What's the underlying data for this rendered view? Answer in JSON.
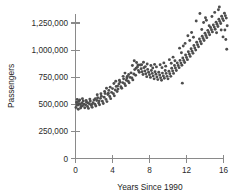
{
  "chart_data": {
    "type": "scatter",
    "title": "",
    "xlabel": "Years Since 1990",
    "ylabel": "Passengers",
    "xlim": [
      0,
      16.5
    ],
    "ylim": [
      0,
      1450000
    ],
    "xticks": [
      0,
      4,
      8,
      12,
      16
    ],
    "xtick_labels": [
      "0",
      "4",
      "8",
      "12",
      "16"
    ],
    "yticks": [
      0,
      250000,
      500000,
      750000,
      1000000,
      1250000
    ],
    "ytick_labels": [
      "0",
      "250,000",
      "500,000",
      "750,000",
      "1,000,000",
      "1,250,000"
    ],
    "grid": false,
    "legend": null,
    "marker_color": "#4d4d4d",
    "axis_color": "#8a8a8a",
    "background_color": "#ffffff",
    "series": [
      {
        "name": "Passengers",
        "points": [
          [
            0.05,
            470000
          ],
          [
            0.12,
            520000
          ],
          [
            0.18,
            545000
          ],
          [
            0.24,
            492000
          ],
          [
            0.3,
            455000
          ],
          [
            0.38,
            505000
          ],
          [
            0.45,
            540000
          ],
          [
            0.52,
            498000
          ],
          [
            0.6,
            478000
          ],
          [
            0.68,
            512000
          ],
          [
            0.76,
            487000
          ],
          [
            0.84,
            530000
          ],
          [
            0.92,
            500000
          ],
          [
            1.0,
            468000
          ],
          [
            1.1,
            495000
          ],
          [
            1.2,
            520000
          ],
          [
            1.3,
            480000
          ],
          [
            1.4,
            462000
          ],
          [
            1.5,
            505000
          ],
          [
            1.6,
            530000
          ],
          [
            1.7,
            490000
          ],
          [
            1.8,
            472000
          ],
          [
            1.9,
            515000
          ],
          [
            2.0,
            540000
          ],
          [
            2.1,
            500000
          ],
          [
            2.2,
            485000
          ],
          [
            2.3,
            535000
          ],
          [
            2.4,
            560000
          ],
          [
            2.5,
            512000
          ],
          [
            2.6,
            496000
          ],
          [
            2.7,
            555000
          ],
          [
            2.8,
            575000
          ],
          [
            2.9,
            528000
          ],
          [
            3.0,
            508000
          ],
          [
            3.1,
            565000
          ],
          [
            3.2,
            600000
          ],
          [
            3.3,
            545000
          ],
          [
            3.4,
            525000
          ],
          [
            3.5,
            590000
          ],
          [
            3.6,
            628000
          ],
          [
            3.7,
            572000
          ],
          [
            3.8,
            552000
          ],
          [
            3.9,
            610000
          ],
          [
            4.0,
            645000
          ],
          [
            4.1,
            598000
          ],
          [
            4.2,
            578000
          ],
          [
            4.3,
            632000
          ],
          [
            4.4,
            665000
          ],
          [
            4.5,
            618000
          ],
          [
            4.6,
            640000
          ],
          [
            4.7,
            688000
          ],
          [
            4.8,
            705000
          ],
          [
            4.9,
            662000
          ],
          [
            5.0,
            648000
          ],
          [
            5.1,
            700000
          ],
          [
            5.2,
            735000
          ],
          [
            5.3,
            690000
          ],
          [
            5.4,
            672000
          ],
          [
            5.5,
            722000
          ],
          [
            5.6,
            758000
          ],
          [
            5.7,
            712000
          ],
          [
            5.8,
            698000
          ],
          [
            5.9,
            748000
          ],
          [
            6.0,
            790000
          ],
          [
            6.1,
            742000
          ],
          [
            6.2,
            725000
          ],
          [
            6.3,
            780000
          ],
          [
            6.4,
            820000
          ],
          [
            6.5,
            768000
          ],
          [
            6.6,
            885000
          ],
          [
            6.7,
            845000
          ],
          [
            6.8,
            812000
          ],
          [
            6.9,
            795000
          ],
          [
            7.0,
            862000
          ],
          [
            7.1,
            828000
          ],
          [
            7.2,
            800000
          ],
          [
            7.3,
            775000
          ],
          [
            7.4,
            838000
          ],
          [
            7.5,
            808000
          ],
          [
            7.6,
            782000
          ],
          [
            7.7,
            755000
          ],
          [
            7.8,
            822000
          ],
          [
            7.9,
            795000
          ],
          [
            8.0,
            772000
          ],
          [
            8.1,
            748000
          ],
          [
            8.2,
            812000
          ],
          [
            8.3,
            785000
          ],
          [
            8.4,
            760000
          ],
          [
            8.5,
            735000
          ],
          [
            8.6,
            800000
          ],
          [
            8.7,
            778000
          ],
          [
            8.8,
            752000
          ],
          [
            8.9,
            728000
          ],
          [
            9.0,
            795000
          ],
          [
            9.1,
            770000
          ],
          [
            9.2,
            745000
          ],
          [
            9.3,
            722000
          ],
          [
            9.4,
            788000
          ],
          [
            9.5,
            762000
          ],
          [
            9.6,
            740000
          ],
          [
            9.7,
            812000
          ],
          [
            9.8,
            785000
          ],
          [
            9.9,
            758000
          ],
          [
            10.0,
            735000
          ],
          [
            10.1,
            805000
          ],
          [
            10.2,
            782000
          ],
          [
            10.3,
            758000
          ],
          [
            10.4,
            832000
          ],
          [
            10.5,
            808000
          ],
          [
            10.6,
            785000
          ],
          [
            10.7,
            858000
          ],
          [
            10.8,
            835000
          ],
          [
            10.9,
            812000
          ],
          [
            11.0,
            882000
          ],
          [
            11.1,
            858000
          ],
          [
            11.2,
            838000
          ],
          [
            11.3,
            905000
          ],
          [
            11.4,
            880000
          ],
          [
            11.5,
            860000
          ],
          [
            11.55,
            695000
          ],
          [
            11.6,
            928000
          ],
          [
            11.7,
            905000
          ],
          [
            11.8,
            885000
          ],
          [
            11.9,
            955000
          ],
          [
            12.0,
            932000
          ],
          [
            12.1,
            912000
          ],
          [
            12.2,
            985000
          ],
          [
            12.3,
            962000
          ],
          [
            12.4,
            942000
          ],
          [
            12.5,
            1012000
          ],
          [
            12.6,
            990000
          ],
          [
            12.7,
            970000
          ],
          [
            12.8,
            1042000
          ],
          [
            12.9,
            1020000
          ],
          [
            13.0,
            1000000
          ],
          [
            13.1,
            1072000
          ],
          [
            13.2,
            1050000
          ],
          [
            13.3,
            1030000
          ],
          [
            13.4,
            1102000
          ],
          [
            13.5,
            1080000
          ],
          [
            13.6,
            1058000
          ],
          [
            13.7,
            1128000
          ],
          [
            13.8,
            1108000
          ],
          [
            13.9,
            1088000
          ],
          [
            14.0,
            1155000
          ],
          [
            14.1,
            1135000
          ],
          [
            14.15,
            1275000
          ],
          [
            14.2,
            1115000
          ],
          [
            14.3,
            1182000
          ],
          [
            14.4,
            1162000
          ],
          [
            14.5,
            1142000
          ],
          [
            14.6,
            1208000
          ],
          [
            14.7,
            1188000
          ],
          [
            14.8,
            1168000
          ],
          [
            14.9,
            1232000
          ],
          [
            15.0,
            1212000
          ],
          [
            15.1,
            1192000
          ],
          [
            15.2,
            1258000
          ],
          [
            15.3,
            1238000
          ],
          [
            15.4,
            1218000
          ],
          [
            15.5,
            1285000
          ],
          [
            15.55,
            1398000
          ],
          [
            15.6,
            1265000
          ],
          [
            15.7,
            1245000
          ],
          [
            15.8,
            1312000
          ],
          [
            15.9,
            1290000
          ],
          [
            16.0,
            1272000
          ],
          [
            16.1,
            1340000
          ],
          [
            16.15,
            1185000
          ],
          [
            16.2,
            1318000
          ],
          [
            16.25,
            1098000
          ],
          [
            16.3,
            1295000
          ],
          [
            16.35,
            1008000
          ],
          [
            16.4,
            1225000
          ],
          [
            13.05,
            1268000
          ],
          [
            13.45,
            1338000
          ],
          [
            13.65,
            1190000
          ],
          [
            13.85,
            1255000
          ],
          [
            14.05,
            1298000
          ],
          [
            14.45,
            1225000
          ],
          [
            14.75,
            1310000
          ],
          [
            15.05,
            1348000
          ],
          [
            15.25,
            1160000
          ],
          [
            15.45,
            1372000
          ],
          [
            15.75,
            1185000
          ],
          [
            15.95,
            1122000
          ],
          [
            12.15,
            1132000
          ],
          [
            12.35,
            1088000
          ],
          [
            12.55,
            1162000
          ],
          [
            12.75,
            1118000
          ],
          [
            11.25,
            1018000
          ],
          [
            11.45,
            975000
          ],
          [
            11.65,
            1038000
          ],
          [
            11.85,
            1062000
          ],
          [
            10.15,
            912000
          ],
          [
            10.35,
            878000
          ],
          [
            10.55,
            935000
          ],
          [
            10.75,
            902000
          ],
          [
            9.15,
            865000
          ],
          [
            9.35,
            838000
          ],
          [
            9.55,
            882000
          ],
          [
            9.75,
            852000
          ],
          [
            8.15,
            858000
          ],
          [
            8.35,
            835000
          ],
          [
            8.55,
            868000
          ],
          [
            8.75,
            845000
          ],
          [
            7.15,
            865000
          ],
          [
            7.35,
            888000
          ],
          [
            7.55,
            848000
          ],
          [
            7.75,
            872000
          ],
          [
            6.15,
            858000
          ],
          [
            6.35,
            902000
          ],
          [
            6.55,
            832000
          ],
          [
            6.75,
            862000
          ],
          [
            5.15,
            758000
          ],
          [
            5.35,
            788000
          ],
          [
            5.55,
            742000
          ],
          [
            5.75,
            775000
          ],
          [
            4.15,
            692000
          ],
          [
            4.35,
            712000
          ],
          [
            4.55,
            668000
          ],
          [
            4.75,
            722000
          ],
          [
            3.15,
            618000
          ],
          [
            3.35,
            648000
          ],
          [
            3.55,
            602000
          ],
          [
            3.75,
            658000
          ],
          [
            2.15,
            552000
          ],
          [
            2.35,
            588000
          ],
          [
            2.55,
            532000
          ],
          [
            2.75,
            598000
          ],
          [
            1.15,
            535000
          ],
          [
            1.35,
            512000
          ],
          [
            1.55,
            548000
          ],
          [
            1.75,
            498000
          ],
          [
            0.15,
            498000
          ],
          [
            0.35,
            528000
          ],
          [
            0.55,
            465000
          ],
          [
            0.75,
            552000
          ]
        ]
      }
    ]
  },
  "axes": {
    "y_title": "Passengers",
    "x_title": "Years Since 1990"
  }
}
